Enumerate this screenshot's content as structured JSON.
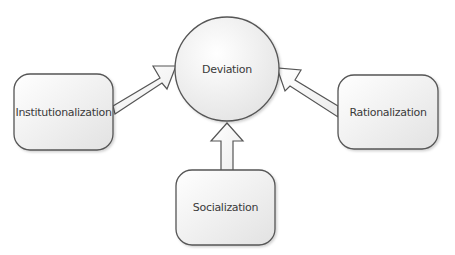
{
  "diagram": {
    "center_node": {
      "label": "Deviation"
    },
    "nodes": [
      {
        "id": "institutionalization",
        "label": "Institutionalization"
      },
      {
        "id": "rationalization",
        "label": "Rationalization"
      },
      {
        "id": "socialization",
        "label": "Socialization"
      }
    ],
    "edges": [
      {
        "from": "Institutionalization",
        "to": "Deviation"
      },
      {
        "from": "Rationalization",
        "to": "Deviation"
      },
      {
        "from": "Socialization",
        "to": "Deviation"
      }
    ],
    "colors": {
      "stroke": "#555555",
      "fill_light": "#ffffff",
      "fill_dark": "#e4e4e4",
      "text": "#3a3a3a"
    }
  }
}
